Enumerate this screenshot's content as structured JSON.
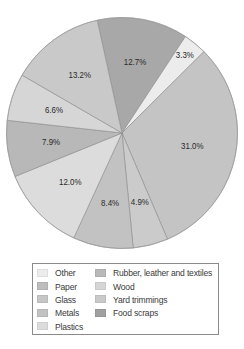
{
  "chart_data": {
    "type": "pie",
    "title": "",
    "start_angle_deg": -12.4,
    "direction": "clockwise",
    "slices": [
      {
        "label": "Food scraps",
        "value": 12.7,
        "display": "12.7%",
        "color": "#a8a8a8"
      },
      {
        "label": "Other",
        "value": 3.3,
        "display": "3.3%",
        "color": "#ececec"
      },
      {
        "label": "Paper",
        "value": 31.0,
        "display": "31.0%",
        "color": "#c4c4c4"
      },
      {
        "label": "Glass",
        "value": 4.9,
        "display": "4.9%",
        "color": "#cbcbcb"
      },
      {
        "label": "Metals",
        "value": 8.4,
        "display": "8.4%",
        "color": "#c2c2c2"
      },
      {
        "label": "Plastics",
        "value": 12.0,
        "display": "12.0%",
        "color": "#dcdcdc"
      },
      {
        "label": "Rubber, leather and textiles",
        "value": 7.9,
        "display": "7.9%",
        "color": "#b8b8b8"
      },
      {
        "label": "Wood",
        "value": 6.6,
        "display": "6.6%",
        "color": "#d6d6d6"
      },
      {
        "label": "Yard trimmings",
        "value": 13.2,
        "display": "13.2%",
        "color": "#c9c9c9"
      }
    ],
    "legend": {
      "position": "bottom",
      "columns": [
        [
          "Other",
          "Paper",
          "Glass",
          "Metals",
          "Plastics"
        ],
        [
          "Rubber, leather and textiles",
          "Wood",
          "Yard trimmings",
          "Food scraps"
        ]
      ]
    },
    "unit": "%"
  },
  "legend": {
    "col0": [
      {
        "label": "Other",
        "color": "#ececec"
      },
      {
        "label": "Paper",
        "color": "#bdbdbd"
      },
      {
        "label": "Glass",
        "color": "#c6c6c6"
      },
      {
        "label": "Metals",
        "color": "#c2c2c2"
      },
      {
        "label": "Plastics",
        "color": "#dcdcdc"
      }
    ],
    "col1": [
      {
        "label": "Rubber, leather and textiles",
        "color": "#b8b8b8"
      },
      {
        "label": "Wood",
        "color": "#d6d6d6"
      },
      {
        "label": "Yard trimmings",
        "color": "#c9c9c9"
      },
      {
        "label": "Food scraps",
        "color": "#a0a0a0"
      }
    ]
  }
}
